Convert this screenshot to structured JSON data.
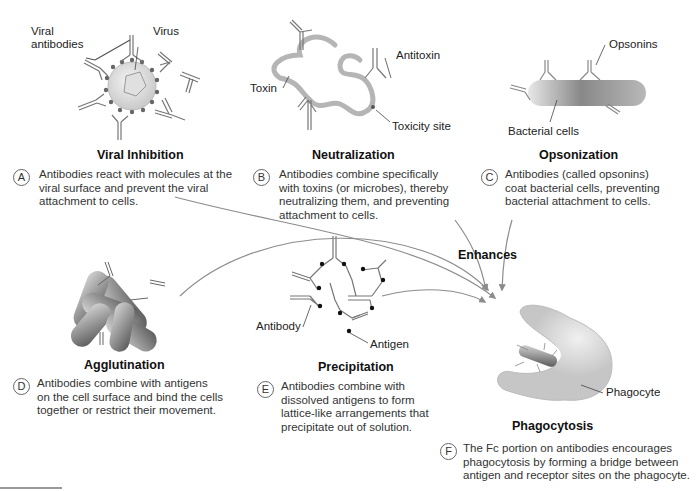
{
  "panels": [
    {
      "id": "A",
      "title": "Viral Inhibition",
      "description": "Antibodies react with molecules at the viral surface and prevent the viral attachment to cells.",
      "labels": [
        "Viral antibodies",
        "Virus"
      ]
    },
    {
      "id": "B",
      "title": "Neutralization",
      "description": "Antibodies combine specifically with toxins (or microbes), thereby neutralizing them, and preventing attachment to cells.",
      "labels": [
        "Antitoxin",
        "Toxin",
        "Toxicity site"
      ]
    },
    {
      "id": "C",
      "title": "Opsonization",
      "description": "Antibodies (called opsonins) coat bacterial cells, preventing bacterial attachment to cells.",
      "labels": [
        "Opsonins",
        "Bacterial cells"
      ]
    },
    {
      "id": "D",
      "title": "Agglutination",
      "description": "Antibodies combine with antigens on the cell surface and bind the cells together or restrict their movement.",
      "labels": []
    },
    {
      "id": "E",
      "title": "Precipitation",
      "description": "Antibodies combine with dissolved antigens to form lattice-like arrangements that precipitate out of solution.",
      "labels": [
        "Antibody",
        "Antigen"
      ]
    },
    {
      "id": "F",
      "title": "Phagocytosis",
      "description": "The Fc portion on antibodies encourages phagocytosis by forming a bridge between antigen and receptor sites on the phagocyte.",
      "labels": [
        "Phagocyte"
      ]
    }
  ],
  "labels": {
    "viral_antibodies_line1": "Viral",
    "viral_antibodies_line2": "antibodies",
    "virus": "Virus",
    "antitoxin": "Antitoxin",
    "toxin": "Toxin",
    "toxicity_site": "Toxicity site",
    "opsonins": "Opsonins",
    "bacterial_cells": "Bacterial cells",
    "antibody": "Antibody",
    "antigen": "Antigen",
    "phagocyte": "Phagocyte",
    "enhances": "Enhances"
  },
  "text": {
    "A_title": "Viral Inhibition",
    "A_badge": "A",
    "A_l1": "Antibodies react with molecules at the",
    "A_l2": "viral surface and prevent the viral",
    "A_l3": "attachment to cells.",
    "B_title": "Neutralization",
    "B_badge": "B",
    "B_l1": "Antibodies combine specifically",
    "B_l2": "with toxins (or microbes), thereby",
    "B_l3": "neutralizing them, and preventing",
    "B_l4": "attachment to cells.",
    "C_title": "Opsonization",
    "C_badge": "C",
    "C_l1": "Antibodies (called opsonins)",
    "C_l2": "coat bacterial cells, preventing",
    "C_l3": "bacterial attachment to cells.",
    "D_title": "Agglutination",
    "D_badge": "D",
    "D_l1": "Antibodies combine with antigens",
    "D_l2": "on the cell surface and bind the cells",
    "D_l3": "together or restrict their movement.",
    "E_title": "Precipitation",
    "E_badge": "E",
    "E_l1": "Antibodies combine with",
    "E_l2": "dissolved antigens to form",
    "E_l3": "lattice-like arrangements that",
    "E_l4": "precipitate out of solution.",
    "F_title": "Phagocytosis",
    "F_badge": "F",
    "F_l1": "The Fc portion on antibodies encourages",
    "F_l2": "phagocytosis by forming a bridge between",
    "F_l3": "antigen and receptor sites on the phagocyte."
  },
  "colors": {
    "antibody_stroke": "#7a7a7a",
    "toxin": "#b5b5b5",
    "phagocyte": "#c8c8c8",
    "arrow": "#8c8c8c",
    "dot": "#222222"
  }
}
